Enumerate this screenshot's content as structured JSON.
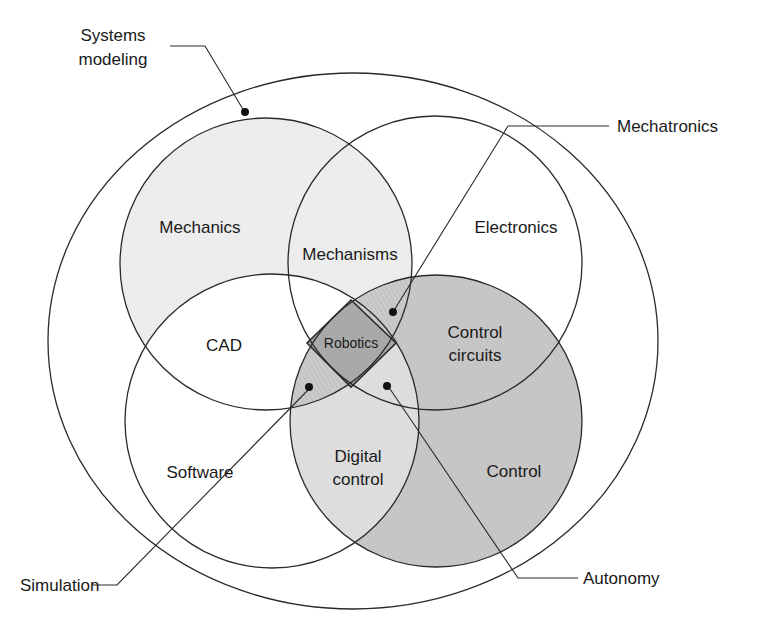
{
  "diagram": {
    "outer_set": {
      "label_lines": [
        "Systems",
        "modeling"
      ]
    },
    "sets": [
      {
        "id": "mechanics",
        "label": "Mechanics",
        "fill": "#ececec"
      },
      {
        "id": "electronics",
        "label": "Electronics",
        "fill": "#ffffff"
      },
      {
        "id": "software",
        "label": "Software",
        "fill": "#ffffff"
      },
      {
        "id": "control",
        "label": "Control",
        "fill": "#c4c4c4"
      }
    ],
    "intersections": {
      "mechanisms": "Mechanisms",
      "cad": "CAD",
      "control_circuits_lines": [
        "Control",
        "circuits"
      ],
      "digital_control_lines": [
        "Digital",
        "control"
      ],
      "robotics": "Robotics"
    },
    "callouts": {
      "mechatronics": "Mechatronics",
      "simulation": "Simulation",
      "autonomy": "Autonomy"
    },
    "colors": {
      "line": "#2a2a2a",
      "light_fill": "#ececec",
      "medium_fill": "#c4c4c4",
      "digital_fill": "#dcdcdc",
      "robotics_fill": "#a9a9a9"
    }
  }
}
